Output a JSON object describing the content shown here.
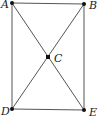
{
  "diagram": {
    "points": [
      {
        "id": "A",
        "label": "A",
        "x": 12,
        "y": 3,
        "lx": 1,
        "ly": 8
      },
      {
        "id": "B",
        "label": "B",
        "x": 84,
        "y": 4,
        "lx": 89,
        "ly": 9
      },
      {
        "id": "C",
        "label": "C",
        "x": 48,
        "y": 57,
        "lx": 54,
        "ly": 62
      },
      {
        "id": "D",
        "label": "D",
        "x": 12,
        "y": 109,
        "lx": 1,
        "ly": 115
      },
      {
        "id": "E",
        "label": "E",
        "x": 84,
        "y": 110,
        "lx": 89,
        "ly": 116
      }
    ],
    "edges": [
      [
        "A",
        "B"
      ],
      [
        "B",
        "E"
      ],
      [
        "E",
        "D"
      ],
      [
        "D",
        "A"
      ],
      [
        "A",
        "E"
      ],
      [
        "B",
        "D"
      ]
    ]
  }
}
